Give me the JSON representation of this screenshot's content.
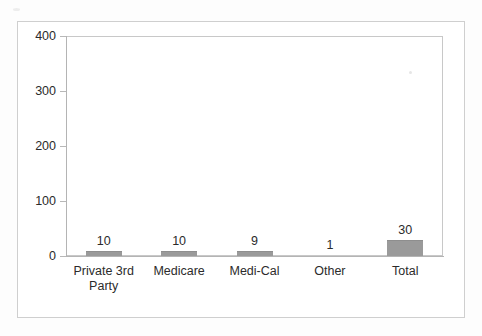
{
  "chart_data": {
    "type": "bar",
    "title": "",
    "subtitle": "",
    "xlabel": "",
    "ylabel": "",
    "categories": [
      "Private 3rd Party",
      "Medicare",
      "Medi-Cal",
      "Other",
      "Total"
    ],
    "category_display": [
      "Private 3rd\nParty",
      "Medicare",
      "Medi-Cal",
      "Other",
      "Total"
    ],
    "values": [
      10,
      10,
      9,
      1,
      30
    ],
    "value_labels": [
      "10",
      "10",
      "9",
      "1",
      "30"
    ],
    "ylim": [
      0,
      400
    ],
    "yticks": [
      0,
      100,
      200,
      300,
      400
    ],
    "ytick_labels": [
      "0",
      "100",
      "200",
      "300",
      "400"
    ],
    "grid": false,
    "legend": false,
    "legend_position": "none",
    "bar_color": "#9a9a9a",
    "axis_color": "#b4b4b4",
    "text_color": "#2b2b2b",
    "plot_border_color": "#c8c8c8",
    "frame_border_color": "#cfcfcf",
    "background": "#ffffff"
  }
}
